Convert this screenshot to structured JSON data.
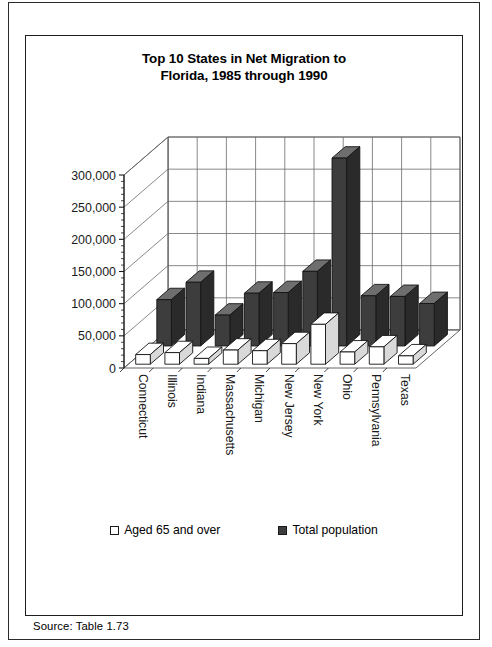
{
  "source_note": "Source:  Table 1.73",
  "chart": {
    "title_line1": "Top 10 States in Net Migration to",
    "title_line2": "Florida, 1985 through 1990",
    "legend": [
      {
        "label": "Aged 65 and over",
        "swatch": "light",
        "color": "#ffffff"
      },
      {
        "label": "Total population",
        "swatch": "dark",
        "color": "#3d3d3d"
      }
    ]
  },
  "chart_data": {
    "type": "bar",
    "title": "Top 10 States in Net Migration to Florida, 1985 through 1990",
    "subtitle": "",
    "xlabel": "",
    "ylabel": "",
    "ylim": [
      0,
      300000
    ],
    "yticks": [
      0,
      50000,
      100000,
      150000,
      200000,
      250000,
      300000
    ],
    "ytick_labels": [
      "0",
      "50,000",
      "100,000",
      "150,000",
      "200,000",
      "250,000",
      "300,000"
    ],
    "grid": true,
    "legend_position": "bottom",
    "three_d": true,
    "categories": [
      "Connecticut",
      "Illinois",
      "Indiana",
      "Massachusetts",
      "Michigan",
      "New Jersey",
      "New York",
      "Ohio",
      "Pennsylvania",
      "Texas"
    ],
    "series": [
      {
        "name": "Aged 65 and over",
        "color": "#ffffff",
        "values": [
          15000,
          18000,
          9000,
          22000,
          21000,
          32000,
          62000,
          19000,
          27000,
          13000
        ]
      },
      {
        "name": "Total population",
        "color": "#3d3d3d",
        "values": [
          72000,
          99000,
          48000,
          82000,
          83000,
          116000,
          292000,
          78000,
          77000,
          66000
        ]
      }
    ]
  }
}
